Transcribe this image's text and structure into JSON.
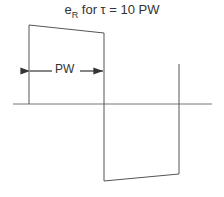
{
  "title": {
    "main": "e",
    "subscript": "R",
    "rest": " for τ = 10 PW"
  },
  "annotation": {
    "pulse_width_label": "PW"
  },
  "waveform": {
    "type": "bipolar pulse with droop",
    "axis_y": 104,
    "axis_x_start": 13,
    "axis_x_end": 212,
    "positive_pulse": {
      "x_start": 29,
      "x_end": 104,
      "top_start": 25,
      "top_end": 33
    },
    "negative_pulse": {
      "x_start": 104,
      "x_end": 179,
      "bottom_start": 181,
      "bottom_end": 174
    },
    "trailing_edge_top": 64,
    "stroke_color": "#555555"
  }
}
